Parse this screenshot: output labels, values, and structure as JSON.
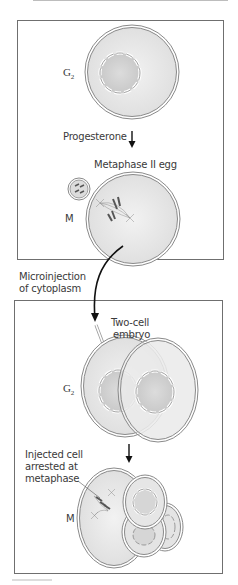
{
  "figure": {
    "top_panel": {
      "stage_label_g2": "G",
      "stage_label_g2_sub": "2",
      "arrow_label": "Progesterone",
      "egg_label": "Metaphase II egg",
      "stage_label_m": "M"
    },
    "transfer": {
      "label_line1": "Microinjection",
      "label_line2": "of cytoplasm"
    },
    "bottom_panel": {
      "embryo_label_line1": "Two-cell",
      "embryo_label_line2": "embryo",
      "stage_label_g2": "G",
      "stage_label_g2_sub": "2",
      "arrest_label_line1": "Injected cell",
      "arrest_label_line2": "arrested at",
      "arrest_label_line3": "metaphase",
      "stage_label_m": "M"
    },
    "colors": {
      "cell_fill": "#e6e6e6",
      "nucleus_fill": "#d2d2d2",
      "membrane": "#8a8a8a",
      "panel_border": "#6f6f6f",
      "text": "#3a3a3a",
      "arrow": "#111111"
    }
  }
}
